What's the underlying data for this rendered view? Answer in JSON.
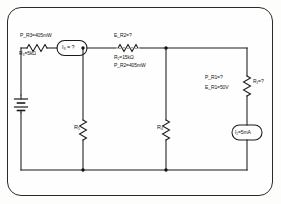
{
  "diagram": {
    "type": "electrical-circuit-schematic",
    "frame": {
      "shape": "rounded-rectangle",
      "border_color": "#2a2a2a"
    },
    "wire_color": "#1a1a1a",
    "labels": {
      "p_r3": "P_R3=405mW",
      "r3_value": "R₃=5kΩ",
      "i3_source": "I₃ = ?",
      "e_r2": "E_R2=?",
      "r2_value": "R₂=15kΩ",
      "p_r2": "P_R2=405mW",
      "r5_value": "R₅",
      "r4_value": "R₄",
      "p_r1": "P_R1=?",
      "e_r1": "E_R1=50V",
      "r1_value": "R₁=?",
      "i1_source": "I₁=5mA"
    },
    "components": [
      {
        "id": "R3",
        "kind": "resistor",
        "orientation": "horizontal",
        "label": "R₃=5kΩ",
        "power": "P_R3=405mW"
      },
      {
        "id": "I3",
        "kind": "current-source",
        "orientation": "horizontal",
        "label": "I₃ = ?"
      },
      {
        "id": "R2",
        "kind": "resistor",
        "orientation": "horizontal",
        "label": "R₂=15kΩ",
        "power": "P_R2=405mW",
        "voltage": "E_R2=?"
      },
      {
        "id": "BAT",
        "kind": "battery",
        "orientation": "vertical"
      },
      {
        "id": "R5",
        "kind": "resistor",
        "orientation": "vertical",
        "label": "R₅"
      },
      {
        "id": "R4",
        "kind": "resistor",
        "orientation": "vertical",
        "label": "R₄"
      },
      {
        "id": "R1",
        "kind": "resistor",
        "orientation": "vertical",
        "label": "R₁=?",
        "power": "P_R1=?",
        "voltage": "E_R1=50V"
      },
      {
        "id": "I1",
        "kind": "current-source",
        "orientation": "vertical",
        "label": "I₁=5mA"
      }
    ],
    "nodes": [
      {
        "id": "n1",
        "x": 83,
        "y": 48
      },
      {
        "id": "n2",
        "x": 166,
        "y": 48
      },
      {
        "id": "n3",
        "x": 83,
        "y": 170
      },
      {
        "id": "n4",
        "x": 166,
        "y": 170
      }
    ]
  }
}
